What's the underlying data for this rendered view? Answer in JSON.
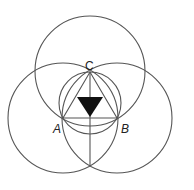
{
  "diagram": {
    "stroke_color": "#555555",
    "fill_color": "#111111",
    "labels": {
      "A": "A",
      "B": "B",
      "C": "C"
    },
    "points": {
      "A": [
        63,
        118
      ],
      "B": [
        117,
        118
      ],
      "C": [
        90,
        72
      ],
      "bottom": [
        90,
        166
      ]
    },
    "circles": [
      {
        "name": "top-circle",
        "cx": 90,
        "cy": 71,
        "r": 55
      },
      {
        "name": "left-circle",
        "cx": 63,
        "cy": 118,
        "r": 55
      },
      {
        "name": "right-circle",
        "cx": 117,
        "cy": 118,
        "r": 55
      },
      {
        "name": "inner-circle",
        "cx": 90,
        "cy": 103,
        "r": 31
      }
    ],
    "filled_triangle": [
      [
        77,
        97
      ],
      [
        103,
        97
      ],
      [
        90,
        117
      ]
    ]
  }
}
